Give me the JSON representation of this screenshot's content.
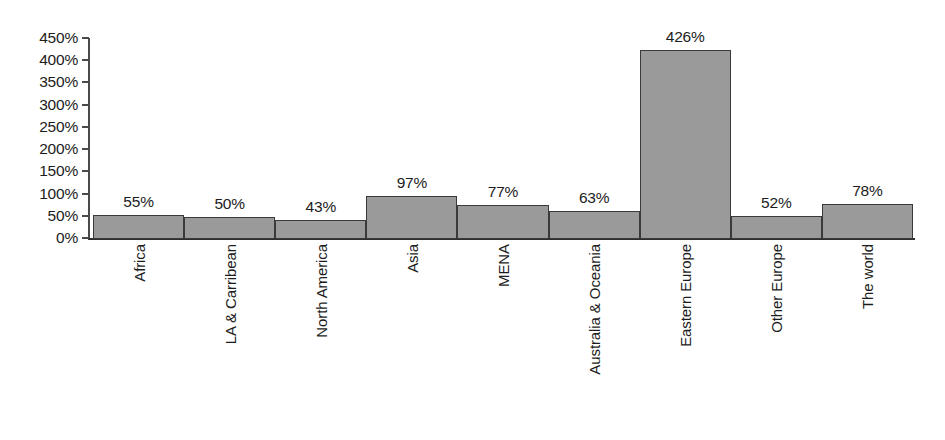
{
  "chart_data": {
    "type": "bar",
    "title": "",
    "subtitle": "",
    "xlabel": "",
    "ylabel": "",
    "categories": [
      "Africa",
      "LA & Carribean",
      "North America",
      "Asia",
      "MENA",
      "Australia & Oceania",
      "Eastern Europe",
      "Other Europe",
      "The world"
    ],
    "values": [
      55,
      50,
      43,
      97,
      77,
      63,
      426,
      52,
      78
    ],
    "value_labels": [
      "55%",
      "50%",
      "43%",
      "97%",
      "77%",
      "63%",
      "426%",
      "52%",
      "78%"
    ],
    "ylim": [
      0,
      450
    ],
    "y_ticks": [
      0,
      50,
      100,
      150,
      200,
      250,
      300,
      350,
      400,
      450
    ],
    "y_tick_labels": [
      "0%",
      "50%",
      "100%",
      "150%",
      "200%",
      "250%",
      "300%",
      "350%",
      "400%",
      "450%"
    ],
    "grid": false,
    "legend": false,
    "legend_position": "none",
    "bar_fill_color": "#9a9a9a",
    "bar_border_color": "#3a3a3a",
    "axis_color": "#3a3a3a",
    "background_color": "#ffffff",
    "text_color": "#1c1c1c"
  }
}
